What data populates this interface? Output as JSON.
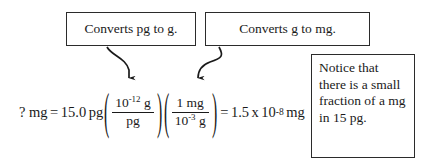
{
  "figure": {
    "type": "unit-conversion-worked-example",
    "callouts": [
      {
        "id": "converts-pg-to-g",
        "text": "Converts pg to g.",
        "points_to": "first-conversion-factor"
      },
      {
        "id": "converts-g-to-mg",
        "text": "Converts g to mg.",
        "points_to": "second-conversion-factor"
      }
    ],
    "notice": {
      "text": "Notice that there is a small fraction of a mg in 15 pg.",
      "lines": [
        "Notice that",
        "there is a",
        "small",
        "fraction of a",
        "mg in 15 pg."
      ]
    },
    "equation": {
      "unknown_label": "? mg",
      "equals_1": "=",
      "given_value": "15.0",
      "given_unit": "pg",
      "open_paren_1": "(",
      "factor1_numerator_coefficient": "10",
      "factor1_numerator_exponent": "-12",
      "factor1_numerator_unit": "g",
      "factor1_denominator": "pg",
      "close_paren_1": ")",
      "open_paren_2": "(",
      "factor2_numerator": "1 mg",
      "factor2_denominator_coefficient": "10",
      "factor2_denominator_exponent": "-3",
      "factor2_denominator_unit": "g",
      "close_paren_2": ")",
      "equals_2": "=",
      "result_coefficient": "1.5",
      "result_times": "x",
      "result_base": "10",
      "result_exponent": "-8",
      "result_unit": "mg",
      "plain_text": "? mg = 15.0 pg (10^-12 g / pg)(1 mg / 10^-3 g) = 1.5 x 10^-8 mg"
    },
    "colors": {
      "ink": "#1a1a1a",
      "border": "#2b2b2b",
      "background": "#ffffff"
    },
    "arrows": [
      {
        "id": "arrow-to-first-factor",
        "from": "converts-pg-to-g",
        "direction": "down-right"
      },
      {
        "id": "arrow-to-second-factor",
        "from": "converts-g-to-mg",
        "direction": "down-left"
      }
    ]
  }
}
